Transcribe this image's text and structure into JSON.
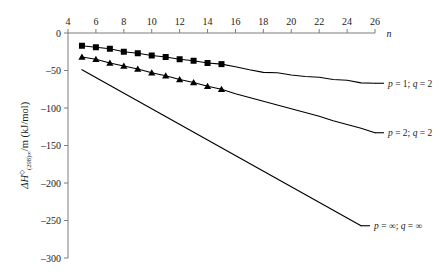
{
  "chart_data": {
    "type": "line",
    "title": "",
    "subtitle": "",
    "xlabel": "n",
    "ylabel": "ΔH⊖(298)∞/m (kJ/mol)",
    "ylabel_parts": {
      "delta": "Δ",
      "h": "H",
      "superscript": "⊖",
      "subscript": "(298)∞",
      "tail": "/m (kJ/mol)"
    },
    "xlim": [
      4,
      26
    ],
    "ylim": [
      -300,
      0
    ],
    "xticks": [
      4,
      6,
      8,
      10,
      12,
      14,
      16,
      18,
      20,
      22,
      24,
      26
    ],
    "xtick_labels": [
      "4",
      "6",
      "8",
      "10",
      "12",
      "14",
      "16",
      "18",
      "20",
      "22",
      "24",
      "26"
    ],
    "yticks": [
      0,
      -50,
      -100,
      -150,
      -200,
      -250,
      -300
    ],
    "ytick_labels": [
      "0",
      "–50",
      "–100",
      "–150",
      "–200",
      "–250",
      "–300"
    ],
    "grid": false,
    "xaxis_position": "top",
    "legend_position": "inline-right",
    "axis_color": "#7d7d7d",
    "line_color": "#000000",
    "series": [
      {
        "name": "p = 1; q = 2",
        "label_html": "p = 1; q = 2",
        "marker": "square",
        "marker_range": [
          5,
          15
        ],
        "x": [
          5,
          6,
          7,
          8,
          9,
          10,
          11,
          12,
          13,
          14,
          15,
          16,
          17,
          18,
          19,
          20,
          21,
          22,
          23,
          24,
          25,
          26
        ],
        "values": [
          -17,
          -19,
          -21,
          -25,
          -27,
          -30,
          -32,
          -35,
          -37,
          -40,
          -41.5,
          -45,
          -49,
          -52.5,
          -53,
          -56,
          -58,
          -59,
          -62,
          -63,
          -66.5,
          -67
        ]
      },
      {
        "name": "p = 2; q = 2",
        "label_html": "p = 2; q = 2",
        "marker": "triangle",
        "marker_range": [
          5,
          15
        ],
        "x": [
          5,
          6,
          7,
          8,
          9,
          10,
          11,
          12,
          13,
          14,
          15,
          16,
          17,
          18,
          19,
          20,
          21,
          22,
          23,
          24,
          25,
          26
        ],
        "values": [
          -32,
          -35,
          -40,
          -44,
          -48,
          -53,
          -57,
          -62,
          -66,
          -71,
          -75,
          -81,
          -86,
          -91,
          -96,
          -101,
          -106,
          -111,
          -117,
          -122,
          -127,
          -133
        ]
      },
      {
        "name": "p = ∞; q = ∞",
        "label_html": "p = ∞; q = ∞",
        "marker": "none",
        "marker_range": null,
        "x": [
          5,
          25
        ],
        "values": [
          -49,
          -257
        ]
      }
    ],
    "annotations": [
      {
        "text": "p = 1; q = 2",
        "x": 26,
        "y": -67
      },
      {
        "text": "p = 2; q = 2",
        "x": 26,
        "y": -133
      },
      {
        "text": "p = ∞; q = ∞",
        "x": 25,
        "y": -257
      }
    ]
  },
  "legend": {
    "items": [
      {
        "p": "1",
        "q": "2",
        "text": "p = 1; q = 2"
      },
      {
        "p": "2",
        "q": "2",
        "text": "p = 2; q = 2"
      },
      {
        "p": "∞",
        "q": "∞",
        "text": "p = ∞; q = ∞"
      }
    ]
  }
}
